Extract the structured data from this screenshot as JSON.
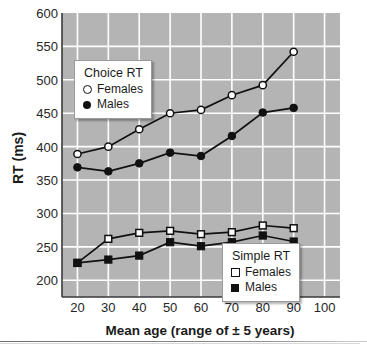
{
  "chart_data": {
    "type": "line",
    "title": "",
    "xlabel": "Mean age (range of ± 5 years)",
    "ylabel": "RT (ms)",
    "x": [
      20,
      30,
      40,
      50,
      60,
      70,
      80,
      90
    ],
    "xlim": [
      15,
      105
    ],
    "ylim": [
      175,
      600
    ],
    "xticks": [
      20,
      30,
      40,
      50,
      60,
      70,
      80,
      90,
      100
    ],
    "yticks": [
      200,
      250,
      300,
      350,
      400,
      450,
      500,
      550,
      600
    ],
    "grid": true,
    "plot_background": "#b4b4b4",
    "grid_color": "#ffffff",
    "series": [
      {
        "name": "Choice RT Females",
        "group": "Choice RT",
        "label": "Females",
        "marker": "open-circle",
        "values": [
          389,
          400,
          426,
          450,
          455,
          477,
          492,
          542
        ]
      },
      {
        "name": "Choice RT Males",
        "group": "Choice RT",
        "label": "Males",
        "marker": "filled-circle",
        "values": [
          369,
          363,
          375,
          391,
          386,
          416,
          451,
          458
        ]
      },
      {
        "name": "Simple RT Females",
        "group": "Simple RT",
        "label": "Females",
        "marker": "open-square",
        "values": [
          226,
          262,
          271,
          274,
          269,
          272,
          282,
          278
        ]
      },
      {
        "name": "Simple RT Males",
        "group": "Simple RT",
        "label": "Males",
        "marker": "filled-square",
        "values": [
          226,
          231,
          237,
          257,
          251,
          257,
          267,
          258
        ]
      }
    ],
    "legends": [
      {
        "id": "choice",
        "title": "Choice RT",
        "position": "upper-left-inside",
        "entries": [
          {
            "marker": "open-circle",
            "label": "Females"
          },
          {
            "marker": "filled-circle",
            "label": "Males"
          }
        ]
      },
      {
        "id": "simple",
        "title": "Simple RT",
        "position": "lower-right-inside",
        "entries": [
          {
            "marker": "open-square",
            "label": "Females"
          },
          {
            "marker": "filled-square",
            "label": "Males"
          }
        ]
      }
    ]
  },
  "axes": {
    "y_tick_labels": [
      "600",
      "550",
      "500",
      "450",
      "400",
      "350",
      "300",
      "250",
      "200"
    ],
    "x_tick_labels": [
      "20",
      "30",
      "40",
      "50",
      "60",
      "70",
      "80",
      "90",
      "100"
    ],
    "y_title": "RT (ms)",
    "x_title": "Mean age (range of ± 5 years)"
  },
  "legend_choice": {
    "title": "Choice RT",
    "females": "Females",
    "males": "Males"
  },
  "legend_simple": {
    "title": "Simple RT",
    "females": "Females",
    "males": "Males"
  }
}
